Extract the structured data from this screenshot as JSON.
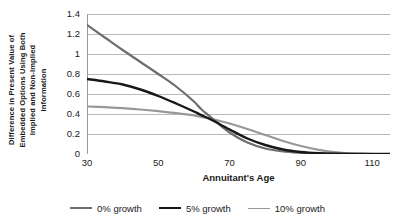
{
  "chart_data": {
    "type": "line",
    "title": "",
    "xlabel": "Annuitant's Age",
    "ylabel": "Difference in Present Value of Embedded Options Using Both Implied and Non-Implied Information",
    "ylabel_lines": [
      "Difference in Present Value of",
      "Embedded Options Using Both",
      "Implied and Non-Implied",
      "Information"
    ],
    "xlim": [
      30,
      115
    ],
    "ylim": [
      0,
      1.4
    ],
    "xticks": [
      30,
      50,
      70,
      90,
      110
    ],
    "yticks": [
      0,
      0.2,
      0.4,
      0.6,
      0.8,
      1,
      1.2,
      1.4
    ],
    "ytick_labels": [
      "0",
      "0.2",
      "0.4",
      "0.6",
      "0.8",
      "1",
      "1.2",
      "1.4"
    ],
    "grid": "horizontal",
    "legend_position": "bottom",
    "x": [
      30,
      35,
      40,
      45,
      50,
      55,
      60,
      62,
      65,
      70,
      75,
      80,
      85,
      90,
      95,
      100,
      105,
      110,
      115
    ],
    "series": [
      {
        "name": "0% growth",
        "color": "#6e6e6e",
        "width": 2.2,
        "values": [
          1.29,
          1.165,
          1.04,
          0.92,
          0.8,
          0.675,
          0.525,
          0.45,
          0.36,
          0.215,
          0.115,
          0.055,
          0.025,
          0.012,
          0.005,
          0.002,
          0.001,
          0.0,
          0.0
        ]
      },
      {
        "name": "5% growth",
        "color": "#171717",
        "width": 2.4,
        "values": [
          0.75,
          0.725,
          0.695,
          0.645,
          0.58,
          0.505,
          0.425,
          0.39,
          0.34,
          0.245,
          0.155,
          0.09,
          0.045,
          0.02,
          0.008,
          0.003,
          0.001,
          0.0,
          0.0
        ]
      },
      {
        "name": "10% growth",
        "color": "#989898",
        "width": 2.2,
        "values": [
          0.475,
          0.468,
          0.458,
          0.445,
          0.428,
          0.408,
          0.385,
          0.372,
          0.35,
          0.305,
          0.25,
          0.19,
          0.13,
          0.08,
          0.042,
          0.016,
          0.004,
          0.0,
          0.0
        ]
      }
    ],
    "legend": [
      {
        "label": "0% growth",
        "color": "#6e6e6e",
        "width": 2.2
      },
      {
        "label": "5% growth",
        "color": "#171717",
        "width": 2.8
      },
      {
        "label": "10% growth",
        "color": "#989898",
        "width": 1.8
      }
    ],
    "colors": {
      "gridline": "#b9b9b9",
      "axis": "#9a9a9a",
      "text": "#1a1a1a",
      "background": "#ffffff"
    }
  }
}
